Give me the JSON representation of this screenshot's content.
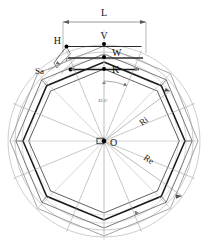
{
  "figure": {
    "background_color": "#ffffff",
    "line_color_dark": "#1a1a1a",
    "line_color_mid": "#555555",
    "line_color_light": "#999999",
    "line_color_faint": "#bbbbbb",
    "point_color": "#000000"
  },
  "labels": {
    "dimension_L": "L",
    "point_H": "H",
    "point_V": "V",
    "point_W": "W",
    "point_K": "K",
    "point_O": "O",
    "thickness_Sa": "Sa",
    "radius_r": "r",
    "radius_inner": "Ri",
    "radius_outer": "Re",
    "angle": "22.5°"
  },
  "geometry": {
    "center_x": 104,
    "center_y": 141,
    "outer_circle_radius": 96,
    "mid_circle_radius": 89,
    "inner_circle_radius": 82,
    "octagon_outer_circumradius": 95,
    "octagon_mid_circumradius": 88,
    "octagon_inner_circumradius": 81,
    "octagon_rotation_deg": 22.5,
    "sector_count": 8,
    "angle_value_deg": 22.5,
    "dimension_L_left_x": 63,
    "dimension_L_right_x": 146,
    "dimension_L_y": 22,
    "point_V_y": 44,
    "point_W_y": 57,
    "point_K_y": 69,
    "point_HK_x": 104
  }
}
